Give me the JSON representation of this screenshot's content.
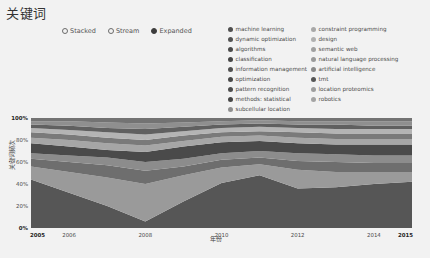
{
  "header": {
    "title": "关键词"
  },
  "mode_selector": {
    "options": [
      {
        "label": "Stacked",
        "selected": false
      },
      {
        "label": "Stream",
        "selected": false
      },
      {
        "label": "Expanded",
        "selected": true
      }
    ]
  },
  "legend": {
    "columns": [
      {
        "items": [
          {
            "label": "machine learning",
            "color": "#4f4f4f"
          },
          {
            "label": "dynamic optimization",
            "color": "#525252"
          },
          {
            "label": "algorithms",
            "color": "#4a4a4a"
          },
          {
            "label": "classification",
            "color": "#454545"
          },
          {
            "label": "information management",
            "color": "#505050"
          },
          {
            "label": "optimization",
            "color": "#484848"
          },
          {
            "label": "pattern recognition",
            "color": "#4d4d4d"
          },
          {
            "label": "methods: statistical",
            "color": "#464646"
          },
          {
            "label": "subcellular location",
            "color": "#8f8f8f"
          }
        ]
      },
      {
        "items": [
          {
            "label": "constraint programming",
            "color": "#a8a8a8"
          },
          {
            "label": "design",
            "color": "#b0b0b0"
          },
          {
            "label": "semantic web",
            "color": "#a0a0a0"
          },
          {
            "label": "natural language processing",
            "color": "#9a9a9a"
          },
          {
            "label": "artificial intelligence",
            "color": "#8a8a8a"
          },
          {
            "label": "tmt",
            "color": "#565656"
          },
          {
            "label": "location proteomics",
            "color": "#9e9e9e"
          },
          {
            "label": "robotics",
            "color": "#a4a4a4"
          }
        ]
      }
    ]
  },
  "chart_data": {
    "type": "area",
    "title": "关键词",
    "subtitle": "",
    "xlabel": "年份",
    "ylabel": "关键词频次",
    "mode": "Expanded",
    "grid": false,
    "legend_position": "top-right",
    "ylim": [
      0,
      100
    ],
    "ytick_labels": [
      "100%",
      "80%",
      "60%",
      "40%",
      "20%",
      "0%"
    ],
    "ytick_values": [
      100,
      80,
      60,
      40,
      20,
      0
    ],
    "xlim": [
      2005,
      2015
    ],
    "xtick_labels": [
      "2005",
      "2006",
      "2008",
      "2010",
      "2012",
      "2014",
      "2015"
    ],
    "xtick_values": [
      2005,
      2006,
      2008,
      2010,
      2012,
      2014,
      2015
    ],
    "x": [
      2005,
      2006,
      2007,
      2008,
      2009,
      2010,
      2011,
      2012,
      2013,
      2014,
      2015
    ],
    "stack_order_bottom_to_top": [
      "machine learning",
      "classification",
      "algorithms",
      "optimization",
      "artificial intelligence",
      "information management",
      "pattern recognition",
      "natural language processing",
      "semantic web",
      "design",
      "constraint programming"
    ],
    "series": [
      {
        "name": "machine learning",
        "color": "#565656",
        "values": [
          44,
          32,
          20,
          6,
          24,
          41,
          48,
          36,
          37,
          40,
          42
        ]
      },
      {
        "name": "classification",
        "color": "#9a9a9a",
        "values": [
          12,
          19,
          26,
          34,
          24,
          14,
          10,
          17,
          14,
          11,
          9
        ]
      },
      {
        "name": "algorithms",
        "color": "#6e6e6e",
        "values": [
          7,
          9,
          11,
          12,
          8,
          7,
          6,
          8,
          9,
          8,
          8
        ]
      },
      {
        "name": "optimization",
        "color": "#8c8c8c",
        "values": [
          5,
          6,
          7,
          8,
          7,
          6,
          6,
          7,
          7,
          7,
          7
        ]
      },
      {
        "name": "artificial intelligence",
        "color": "#4a4a4a",
        "values": [
          9,
          8,
          7,
          9,
          11,
          10,
          9,
          9,
          9,
          10,
          10
        ]
      },
      {
        "name": "information management",
        "color": "#a6a6a6",
        "values": [
          5,
          6,
          6,
          6,
          5,
          5,
          5,
          5,
          5,
          5,
          5
        ]
      },
      {
        "name": "pattern recognition",
        "color": "#7a7a7a",
        "values": [
          5,
          5,
          5,
          5,
          5,
          4,
          4,
          5,
          5,
          5,
          5
        ]
      },
      {
        "name": "natural language processing",
        "color": "#b4b4b4",
        "values": [
          4,
          4,
          5,
          5,
          4,
          4,
          4,
          4,
          4,
          4,
          4
        ]
      },
      {
        "name": "semantic web",
        "color": "#606060",
        "values": [
          3,
          4,
          4,
          5,
          4,
          3,
          3,
          3,
          4,
          3,
          3
        ]
      },
      {
        "name": "design",
        "color": "#8f8f8f",
        "values": [
          3,
          4,
          5,
          5,
          4,
          3,
          3,
          3,
          3,
          4,
          4
        ]
      },
      {
        "name": "constraint programming",
        "color": "#737373",
        "values": [
          3,
          3,
          4,
          5,
          4,
          3,
          2,
          3,
          3,
          3,
          3
        ]
      }
    ]
  }
}
